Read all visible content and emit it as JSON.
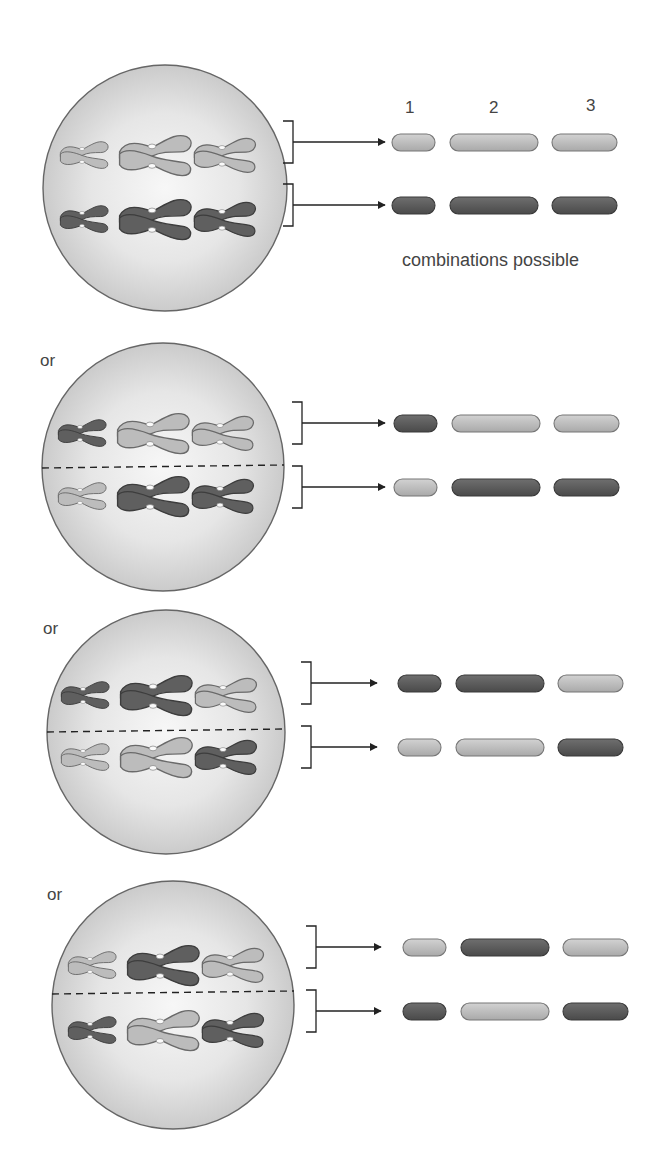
{
  "diagram": {
    "column_numbers": [
      "1",
      "2",
      "3"
    ],
    "caption": "combinations possible",
    "or_label": "or",
    "colors": {
      "light_chromosome": "#bdbdbd",
      "dark_chromosome": "#5e5e5e",
      "outline": "#555555",
      "cell_fill_center": "#f4f4f4",
      "cell_fill_edge": "#cfcfcf",
      "line": "#222222"
    },
    "panels": [
      {
        "id": 1,
        "show_or": false,
        "divider": false,
        "top_row": [
          "light",
          "light",
          "light"
        ],
        "bottom_row": [
          "dark",
          "dark",
          "dark"
        ],
        "result_top": [
          "light",
          "light",
          "light"
        ],
        "result_bottom": [
          "dark",
          "dark",
          "dark"
        ]
      },
      {
        "id": 2,
        "show_or": true,
        "divider": true,
        "top_row": [
          "dark",
          "light",
          "light"
        ],
        "bottom_row": [
          "light",
          "dark",
          "dark"
        ],
        "result_top": [
          "dark",
          "light",
          "light"
        ],
        "result_bottom": [
          "light",
          "dark",
          "dark"
        ]
      },
      {
        "id": 3,
        "show_or": true,
        "divider": true,
        "top_row": [
          "dark",
          "dark",
          "light"
        ],
        "bottom_row": [
          "light",
          "light",
          "dark"
        ],
        "result_top": [
          "dark",
          "dark",
          "light"
        ],
        "result_bottom": [
          "light",
          "light",
          "dark"
        ]
      },
      {
        "id": 4,
        "show_or": true,
        "divider": true,
        "top_row": [
          "light",
          "dark",
          "light"
        ],
        "bottom_row": [
          "dark",
          "light",
          "dark"
        ],
        "result_top": [
          "light",
          "dark",
          "light"
        ],
        "result_bottom": [
          "dark",
          "light",
          "dark"
        ]
      }
    ]
  }
}
